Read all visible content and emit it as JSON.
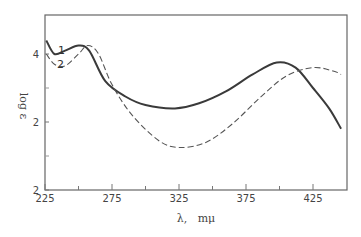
{
  "chart_data": {
    "type": "line",
    "title": "",
    "xlabel": "λ,   mμ",
    "ylabel": "log ε",
    "xlim": [
      225,
      450
    ],
    "ylim": [
      0,
      5.2
    ],
    "grid": false,
    "legend": "inline curve labels '1' and '2' near left",
    "x_ticks": [
      225,
      250,
      275,
      300,
      325,
      350,
      375,
      400,
      425
    ],
    "x_tick_labels": [
      "225",
      "275",
      "325",
      "375",
      "425"
    ],
    "y_tick_labels": [
      {
        "value": 4,
        "label": "4"
      },
      {
        "value": 2,
        "label": "2"
      },
      {
        "value": 0,
        "label": "2"
      }
    ],
    "y_minor_ticks": [
      3,
      1
    ],
    "series": [
      {
        "name": "1",
        "style": "solid",
        "x": [
          226,
          232,
          240,
          250,
          258,
          270,
          285,
          300,
          322,
          340,
          360,
          380,
          398,
          412,
          425,
          437,
          446
        ],
        "y": [
          4.4,
          4.0,
          4.1,
          4.25,
          4.1,
          3.2,
          2.75,
          2.5,
          2.4,
          2.55,
          2.9,
          3.4,
          3.75,
          3.6,
          3.0,
          2.4,
          1.8
        ]
      },
      {
        "name": "2",
        "style": "dashed",
        "x": [
          226,
          232,
          240,
          250,
          257,
          265,
          275,
          290,
          310,
          325,
          345,
          365,
          385,
          405,
          425,
          440,
          446
        ],
        "y": [
          4.0,
          3.7,
          3.65,
          4.0,
          4.25,
          4.0,
          3.1,
          2.2,
          1.45,
          1.25,
          1.4,
          1.95,
          2.7,
          3.35,
          3.6,
          3.5,
          3.4
        ]
      }
    ]
  },
  "labels": {
    "curve1": "1",
    "curve2": "2"
  }
}
